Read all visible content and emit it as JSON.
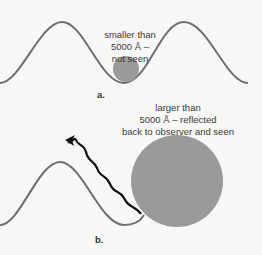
{
  "panel_a": {
    "label_line1": "smaller than",
    "label_line2": "5000 Å –",
    "label_line3": "not seen",
    "caption": "a."
  },
  "panel_b": {
    "label_line1": "larger than",
    "label_line2": "5000 Å – reflected",
    "label_line3": "back to observer and seen",
    "caption": "b."
  },
  "colors": {
    "wave": "#6e6e6e",
    "particle": "#9a9a9a",
    "reflected_ray": "#111111",
    "background": "#f7f7f5"
  }
}
